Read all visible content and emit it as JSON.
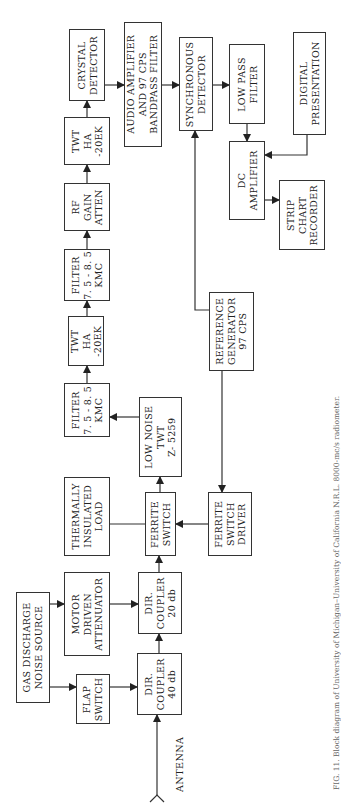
{
  "diagram": {
    "orientation": "rotated-90-ccw",
    "blocks": {
      "crystal_detector": [
        "CRYSTAL",
        "DETECTOR"
      ],
      "twt_upper": [
        "TWT",
        "HA",
        "-20EK"
      ],
      "rf_gain_atten": [
        "RF",
        "GAIN",
        "ATTEN"
      ],
      "filter_upper": [
        "FILTER",
        "7. 5 - 8. 5",
        "KMC"
      ],
      "twt_lower": [
        "TWT",
        "HA",
        "-20EK"
      ],
      "filter_lower": [
        "FILTER",
        "7. 5 - 8. 5",
        "KMC"
      ],
      "low_noise_twt": [
        "LOW NOISE",
        "TWT",
        "Z- 5259"
      ],
      "thermally_insulated_load": [
        "THERMALLY",
        "INSULATED",
        "LOAD"
      ],
      "ferrite_switch": [
        "FERRITE",
        "SWITCH"
      ],
      "ferrite_switch_driver": [
        "FERRITE",
        "SWITCH",
        "DRIVER"
      ],
      "motor_driven_attenuator": [
        "MOTOR",
        "DRIVEN",
        "ATTENUATOR"
      ],
      "dir_coupler_20": [
        "DIR.",
        "COUPLER",
        "20 db"
      ],
      "gas_discharge_noise_source": [
        "GAS DISCHARGE",
        "NOISE SOURCE"
      ],
      "flap_switch": [
        "FLAP",
        "SWITCH"
      ],
      "dir_coupler_40": [
        "DIR.",
        "COUPLER",
        "40 db"
      ],
      "audio_amplifier": [
        "AUDIO AMPLIFIER",
        "AND 97 CPS",
        "BANDPASS FILTER"
      ],
      "synchronous_detector": [
        "SYNCHRONOUS",
        "DETECTOR"
      ],
      "reference_generator": [
        "REFERENCE",
        "GENERATOR",
        "97 CPS"
      ],
      "low_pass_filter": [
        "LOW PASS",
        "FILTER"
      ],
      "dc_amplifier": [
        "DC",
        "AMPLIFIER"
      ],
      "digital_presentation": [
        "DIGITAL",
        "PRESENTATION"
      ],
      "strip_chart_recorder": [
        "STRIP",
        "CHART",
        "RECORDER"
      ]
    },
    "antenna_label": "ANTENNA",
    "caption": "FIG. 11. Block diagram of University of Michigan–University of California N.R.L. 8000-mc/s radiometer."
  }
}
